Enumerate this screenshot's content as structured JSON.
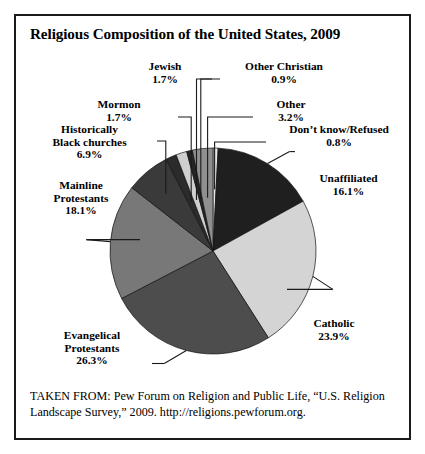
{
  "figure": {
    "title": "Religious Composition of the United States, 2009",
    "source_note": "TAKEN FROM: Pew Forum on Religion and Public Life, “U.S. Religion Landscape Survey,” 2009. http://religions.pewforum.org."
  },
  "labels": {
    "jewish": {
      "name": "Jewish",
      "pct": "1.7%"
    },
    "mormon": {
      "name": "Mormon",
      "pct": "1.7%"
    },
    "historically_black": {
      "line1": "Historically",
      "line2": "Black churches",
      "pct": "6.9%"
    },
    "mainline": {
      "line1": "Mainline",
      "line2": "Protestants",
      "pct": "18.1%"
    },
    "evangelical": {
      "line1": "Evangelical",
      "line2": "Protestants",
      "pct": "26.3%"
    },
    "other_christian": {
      "name": "Other Christian",
      "pct": "0.9%"
    },
    "other": {
      "name": "Other",
      "pct": "3.2%"
    },
    "dont_know": {
      "name": "Don’t know/Refused",
      "pct": "0.8%"
    },
    "unaffiliated": {
      "name": "Unaffiliated",
      "pct": "16.1%"
    },
    "catholic": {
      "name": "Catholic",
      "pct": "23.9%"
    }
  },
  "chart_data": {
    "type": "pie",
    "title": "Religious Composition of the United States, 2009",
    "unit": "percent",
    "total": 99.6,
    "start_angle_deg": 0,
    "direction": "clockwise",
    "legend": "none-labels-with-leader-lines",
    "categories": [
      "Don’t know/Refused",
      "Unaffiliated",
      "Catholic",
      "Evangelical Protestants",
      "Mainline Protestants",
      "Historically Black churches",
      "Mormon",
      "Jewish",
      "Other Christian",
      "Other"
    ],
    "values": [
      0.8,
      16.1,
      23.9,
      26.3,
      18.1,
      6.9,
      1.7,
      1.7,
      0.9,
      3.2
    ],
    "colors": [
      "#e8e8e8",
      "#1f1f1f",
      "#d4d4d4",
      "#4d4d4d",
      "#787878",
      "#3a3a3a",
      "#2b2b2b",
      "#cfcfcf",
      "#242424",
      "#8f8f8f"
    ],
    "slices": [
      {
        "label": "Don’t know/Refused",
        "value": 0.8,
        "color": "#e8e8e8"
      },
      {
        "label": "Unaffiliated",
        "value": 16.1,
        "color": "#1f1f1f"
      },
      {
        "label": "Catholic",
        "value": 23.9,
        "color": "#d4d4d4"
      },
      {
        "label": "Evangelical Protestants",
        "value": 26.3,
        "color": "#4d4d4d"
      },
      {
        "label": "Mainline Protestants",
        "value": 18.1,
        "color": "#787878"
      },
      {
        "label": "Historically Black churches",
        "value": 6.9,
        "color": "#3a3a3a"
      },
      {
        "label": "Mormon",
        "value": 1.7,
        "color": "#2b2b2b"
      },
      {
        "label": "Jewish",
        "value": 1.7,
        "color": "#cfcfcf"
      },
      {
        "label": "Other Christian",
        "value": 0.9,
        "color": "#242424"
      },
      {
        "label": "Other",
        "value": 3.2,
        "color": "#8f8f8f"
      }
    ]
  },
  "geometry": {
    "cx": 197,
    "cy": 235,
    "r": 103
  }
}
